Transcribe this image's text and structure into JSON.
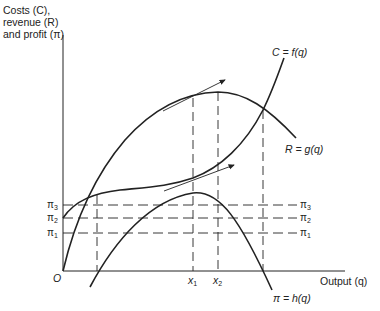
{
  "axes": {
    "y_label_lines": [
      "Costs (C),",
      "revenue (R)",
      "and profit (π)"
    ],
    "x_label": "Output (q)",
    "origin_label": "O"
  },
  "curves": {
    "cost": "C = f(q)",
    "revenue": "R = g(q)",
    "profit": "π = h(q)"
  },
  "levels": {
    "pi3": "π",
    "pi3_sub": "3",
    "pi2": "π",
    "pi2_sub": "2",
    "pi1": "π",
    "pi1_sub": "1"
  },
  "x_ticks": {
    "x1": "x",
    "x1_sub": "1",
    "x2": "x",
    "x2_sub": "2"
  },
  "colors": {
    "line": "#222222",
    "background": "#ffffff"
  }
}
